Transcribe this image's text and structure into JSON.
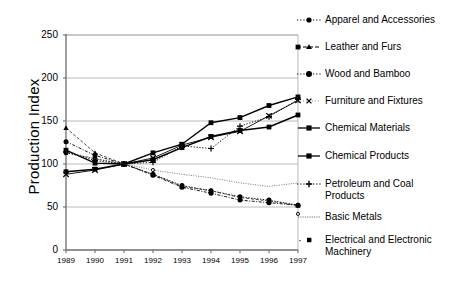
{
  "chart_data": {
    "type": "line",
    "title": "",
    "subtitle": "",
    "xlabel": "",
    "ylabel": "Production Index",
    "x": [
      1989,
      1990,
      1991,
      1992,
      1993,
      1994,
      1995,
      1996,
      1997
    ],
    "xticklabels": [
      "1989",
      "1990",
      "1991",
      "1992",
      "1993",
      "1994",
      "1995",
      "1996",
      "1997"
    ],
    "yticklabels": [
      "0",
      "50",
      "100",
      "150",
      "200",
      "250"
    ],
    "ytickvalues": [
      0,
      50,
      100,
      150,
      200,
      250
    ],
    "ylim": [
      0,
      250
    ],
    "xlim": [
      1989,
      1997
    ],
    "grid": "horizontal",
    "legend_position": "right",
    "series": [
      {
        "name": "Apparel and Accessories",
        "marker": "filled-circle",
        "line": "dotted",
        "values": [
          113,
          106,
          100,
          88,
          75,
          69,
          62,
          58,
          52
        ]
      },
      {
        "name": "Leather and Furs",
        "marker": "small-triangle",
        "line": "dashed",
        "values": [
          142,
          113,
          100,
          88,
          74,
          69,
          61,
          57,
          52
        ]
      },
      {
        "name": "Wood and Bamboo",
        "marker": "filled-circle",
        "line": "dash-dot",
        "values": [
          126,
          110,
          100,
          87,
          73,
          66,
          58,
          55,
          52
        ]
      },
      {
        "name": "Furniture and Fixtures",
        "marker": "x-cross",
        "line": "thin-solid",
        "values": [
          88,
          93,
          100,
          107,
          122,
          131,
          138,
          156,
          174
        ]
      },
      {
        "name": "Chemical Materials",
        "marker": "filled-square",
        "line": "solid",
        "values": [
          116,
          101,
          100,
          113,
          123,
          148,
          154,
          168,
          178
        ]
      },
      {
        "name": "Chemical Products",
        "marker": "filled-square",
        "line": "solid",
        "values": [
          91,
          94,
          100,
          105,
          119,
          132,
          139,
          143,
          157
        ]
      },
      {
        "name": "Petroleum and Coal\nProducts",
        "marker": "plus",
        "line": "dotted",
        "values": [
          114,
          104,
          100,
          102,
          121,
          118,
          144,
          155,
          175
        ]
      },
      {
        "name": "Basic Metals",
        "marker": "none",
        "line": "fine-dotted",
        "values": [
          114,
          106,
          100,
          93,
          88,
          84,
          78,
          74,
          78
        ]
      },
      {
        "name": "Electrical and Electronic\n   Machinery",
        "marker": "filled-square",
        "line": "sparse-dotted",
        "values": [
          null,
          null,
          null,
          null,
          null,
          null,
          null,
          null,
          236
        ]
      }
    ],
    "extra_points": [
      {
        "series": "Basic Metals",
        "x": 1992,
        "y": 93
      },
      {
        "series": "Apparel and Accessories",
        "x": 1994,
        "y": 69
      },
      {
        "series": "Wood and Bamboo",
        "x": 1997,
        "y": 42
      }
    ]
  },
  "legend": {
    "items": [
      {
        "label": "Apparel and Accessories",
        "key": "dotted-circle-key"
      },
      {
        "label": "Leather and Furs",
        "key": "dashed-triangle-key"
      },
      {
        "label": "Wood and Bamboo",
        "key": "dashdot-circle-key"
      },
      {
        "label": "Furniture and Fixtures",
        "key": "dotted-x-key"
      },
      {
        "label": "Chemical Materials",
        "key": "solid-square-key"
      },
      {
        "label": "Chemical Products",
        "key": "solid-square-key"
      },
      {
        "label": "Petroleum and Coal\nProducts",
        "key": "dotted-plus-key"
      },
      {
        "label": "Basic Metals",
        "key": "fine-dotted-key"
      },
      {
        "label": "Electrical and Electronic\n   Machinery",
        "key": "sparse-square-key"
      }
    ]
  },
  "axis": {
    "ylabel": "Production Index",
    "yticks": [
      "250",
      "200",
      "150",
      "100",
      "50",
      "0"
    ],
    "xticks": [
      "1989",
      "1990",
      "1991",
      "1992",
      "1993",
      "1994",
      "1995",
      "1996",
      "1997"
    ]
  },
  "colors": {
    "line": "#000000",
    "grid": "#a8a8a8",
    "axis": "#6e6e6e",
    "background": "#ffffff"
  }
}
